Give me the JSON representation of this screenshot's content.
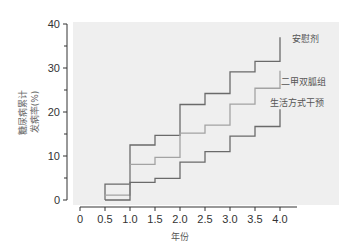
{
  "chart_data": {
    "type": "line",
    "step": true,
    "title": "",
    "xlabel": "年份",
    "ylabel": [
      "糖尿病累计",
      "发病率(%)"
    ],
    "xlim": [
      0,
      4.0
    ],
    "ylim": [
      0,
      40
    ],
    "x_ticks": [
      "0",
      "0.5",
      "1.0",
      "1.5",
      "2.0",
      "2.5",
      "3.0",
      "3.5",
      "4.0"
    ],
    "y_ticks": [
      "0",
      "10",
      "20",
      "30",
      "40"
    ],
    "grid": false,
    "legend_position": "inline-right",
    "x": [
      0.5,
      1.0,
      1.5,
      2.0,
      2.5,
      3.0,
      3.5,
      4.0
    ],
    "series": [
      {
        "name": "安慰剂",
        "color": "#6a6a6a",
        "values": [
          3.6,
          12.5,
          14.7,
          21.7,
          24.2,
          29.1,
          31.5,
          37.0
        ]
      },
      {
        "name": "二甲双胍组",
        "color": "#a3a3a3",
        "values": [
          1.1,
          8.1,
          9.7,
          15.2,
          17.0,
          21.8,
          25.4,
          29.4
        ]
      },
      {
        "name": "生活方式干预",
        "color": "#6a6a6a",
        "values": [
          0.0,
          4.0,
          4.9,
          8.6,
          11.0,
          14.5,
          16.7,
          20.6
        ]
      }
    ]
  },
  "colors": {
    "plot_background": "#efefef",
    "axis": "#333333",
    "page": "#ffffff"
  }
}
